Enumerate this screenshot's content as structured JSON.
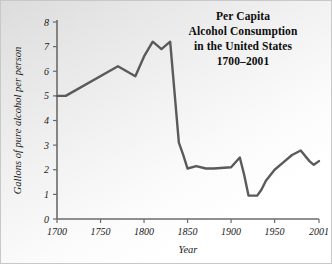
{
  "chart_data": {
    "type": "line",
    "title": "Per Capita Alcohol Consumption in the United States 1700–2001",
    "title_lines": [
      "Per Capita",
      "Alcohol Consumption",
      "in the United States",
      "1700–2001"
    ],
    "xlabel": "Year",
    "ylabel": "Gallons of pure alcohol per person",
    "xlim": [
      1700,
      2001
    ],
    "ylim": [
      0,
      8
    ],
    "xticks": [
      1700,
      1750,
      1800,
      1850,
      1900,
      1950,
      2001
    ],
    "xtick_labels": [
      "1700",
      "1750",
      "1800",
      "1850",
      "1900",
      "1950",
      "2001"
    ],
    "yticks": [
      0,
      1,
      2,
      3,
      4,
      5,
      6,
      7,
      8
    ],
    "ytick_labels": [
      "0",
      "1",
      "2",
      "3",
      "4",
      "5",
      "6",
      "7",
      "8"
    ],
    "grid": false,
    "legend": false,
    "line_color": "#5a5a5a",
    "axis_color": "#6b6b6b",
    "series": [
      {
        "name": "Gallons of pure alcohol per person",
        "x": [
          1700,
          1710,
          1770,
          1790,
          1800,
          1810,
          1820,
          1830,
          1840,
          1845,
          1850,
          1860,
          1871,
          1880,
          1900,
          1910,
          1915,
          1920,
          1930,
          1935,
          1940,
          1950,
          1960,
          1970,
          1980,
          1990,
          1995,
          2001
        ],
        "values": [
          5.0,
          5.0,
          6.2,
          5.8,
          6.6,
          7.2,
          6.9,
          7.2,
          3.1,
          2.6,
          2.05,
          2.15,
          2.05,
          2.05,
          2.1,
          2.5,
          1.8,
          0.95,
          0.95,
          1.2,
          1.55,
          2.0,
          2.3,
          2.6,
          2.78,
          2.35,
          2.2,
          2.35
        ]
      }
    ]
  },
  "axes": {
    "y_axis_name": "y-axis",
    "x_axis_name": "x-axis"
  }
}
